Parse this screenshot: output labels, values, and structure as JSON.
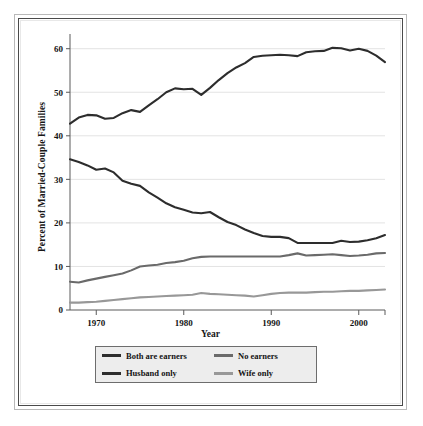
{
  "figure": {
    "frame_color_outer": "#b9b9b9",
    "frame_color_inner": "#4a4a4a",
    "background": "#ffffff"
  },
  "legend": {
    "position": "below-axis",
    "background": "#ededed",
    "border_color": "#6d6d6d",
    "entries": [
      {
        "label": "Both are earners",
        "color": "#2d2d2d"
      },
      {
        "label": "No earners",
        "color": "#6a6a6a"
      },
      {
        "label": "Husband only",
        "color": "#2d2d2d"
      },
      {
        "label": "Wife only",
        "color": "#989898"
      }
    ]
  },
  "chart_data": {
    "type": "line",
    "title": "",
    "xlabel": "Year",
    "ylabel": "Percent of Married-Couple Families",
    "xlim": [
      1967,
      2003
    ],
    "ylim": [
      0,
      62
    ],
    "xticks": [
      1970,
      1980,
      1990,
      2000
    ],
    "xtick_labels": [
      "1970",
      "1980",
      "1990",
      "2000"
    ],
    "yticks": [
      0,
      10,
      20,
      30,
      40,
      50,
      60
    ],
    "ytick_labels": [
      "0",
      "10",
      "20",
      "30",
      "40",
      "50",
      "60"
    ],
    "grid": "horizontal",
    "grid_color": "#e3e3e3",
    "legend_position": "below",
    "x": [
      1967,
      1968,
      1969,
      1970,
      1971,
      1972,
      1973,
      1974,
      1975,
      1976,
      1977,
      1978,
      1979,
      1980,
      1981,
      1982,
      1983,
      1984,
      1985,
      1986,
      1987,
      1988,
      1989,
      1990,
      1991,
      1992,
      1993,
      1994,
      1995,
      1996,
      1997,
      1998,
      1999,
      2000,
      2001,
      2002,
      2003
    ],
    "series": [
      {
        "name": "Both are earners",
        "color": "#2d2d2d",
        "values": [
          42.8,
          44.2,
          44.8,
          44.7,
          43.9,
          44.1,
          45.2,
          45.9,
          45.5,
          47.0,
          48.4,
          50.0,
          50.9,
          50.7,
          50.8,
          49.4,
          51.0,
          52.8,
          54.4,
          55.7,
          56.7,
          58.1,
          58.4,
          58.5,
          58.6,
          58.5,
          58.3,
          59.2,
          59.4,
          59.5,
          60.2,
          60.1,
          59.6,
          60.0,
          59.5,
          58.4,
          56.9
        ]
      },
      {
        "name": "Husband only",
        "color": "#2d2d2d",
        "values": [
          34.6,
          34.0,
          33.2,
          32.2,
          32.5,
          31.6,
          29.7,
          29.0,
          28.5,
          27.0,
          25.8,
          24.5,
          23.6,
          23.0,
          22.4,
          22.2,
          22.5,
          21.3,
          20.2,
          19.5,
          18.5,
          17.7,
          17.0,
          16.8,
          16.8,
          16.5,
          15.4,
          15.4,
          15.4,
          15.4,
          15.4,
          15.9,
          15.6,
          15.7,
          16.0,
          16.5,
          17.2
        ]
      },
      {
        "name": "No earners",
        "color": "#6a6a6a",
        "values": [
          6.5,
          6.3,
          6.8,
          7.2,
          7.6,
          8.0,
          8.4,
          9.1,
          10.0,
          10.2,
          10.4,
          10.8,
          11.0,
          11.3,
          11.9,
          12.2,
          12.3,
          12.3,
          12.3,
          12.3,
          12.3,
          12.3,
          12.3,
          12.3,
          12.3,
          12.6,
          13.0,
          12.5,
          12.6,
          12.7,
          12.8,
          12.6,
          12.4,
          12.5,
          12.7,
          13.0,
          13.1
        ]
      },
      {
        "name": "Wife only",
        "color": "#989898",
        "values": [
          1.7,
          1.7,
          1.8,
          1.9,
          2.1,
          2.3,
          2.5,
          2.7,
          2.9,
          3.0,
          3.1,
          3.2,
          3.3,
          3.4,
          3.5,
          3.9,
          3.7,
          3.6,
          3.5,
          3.4,
          3.3,
          3.1,
          3.4,
          3.7,
          3.9,
          4.0,
          4.0,
          4.0,
          4.1,
          4.2,
          4.2,
          4.3,
          4.4,
          4.4,
          4.5,
          4.6,
          4.7
        ]
      }
    ]
  }
}
